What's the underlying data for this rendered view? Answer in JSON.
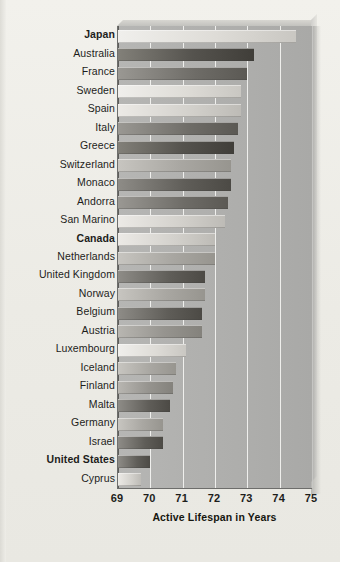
{
  "chart_data": {
    "type": "bar",
    "orientation": "horizontal",
    "title": "",
    "xlabel": "Active Lifespan in Years",
    "ylabel": "",
    "xlim": [
      69,
      75
    ],
    "xticks": [
      69,
      70,
      71,
      72,
      73,
      74,
      75
    ],
    "grid": true,
    "legend": "none",
    "highlighted_categories": [
      "Japan",
      "Canada",
      "United States"
    ],
    "categories": [
      "Japan",
      "Australia",
      "France",
      "Sweden",
      "Spain",
      "Italy",
      "Greece",
      "Switzerland",
      "Monaco",
      "Andorra",
      "San Marino",
      "Canada",
      "Netherlands",
      "United Kingdom",
      "Norway",
      "Belgium",
      "Austria",
      "Luxembourg",
      "Iceland",
      "Finland",
      "Malta",
      "Germany",
      "Israel",
      "United States",
      "Cyprus"
    ],
    "values": [
      74.5,
      73.2,
      73.0,
      72.8,
      72.8,
      72.7,
      72.6,
      72.5,
      72.5,
      72.4,
      72.3,
      72.0,
      72.0,
      71.7,
      71.7,
      71.6,
      71.6,
      71.1,
      70.8,
      70.7,
      70.6,
      70.4,
      70.4,
      70.0,
      69.7
    ],
    "bar_shades": [
      "light",
      "verydark",
      "dark",
      "light",
      "pale",
      "dark",
      "verydark",
      "mid",
      "darker",
      "dark",
      "pale",
      "pale",
      "mid",
      "darker",
      "mid",
      "darker",
      "medium",
      "light",
      "mid",
      "medium",
      "darker",
      "mid",
      "darker",
      "darker",
      "pale"
    ]
  },
  "axis": {
    "x_title": "Active Lifespan in Years",
    "tick_labels": [
      "69",
      "70",
      "71",
      "72",
      "73",
      "74",
      "75"
    ]
  }
}
